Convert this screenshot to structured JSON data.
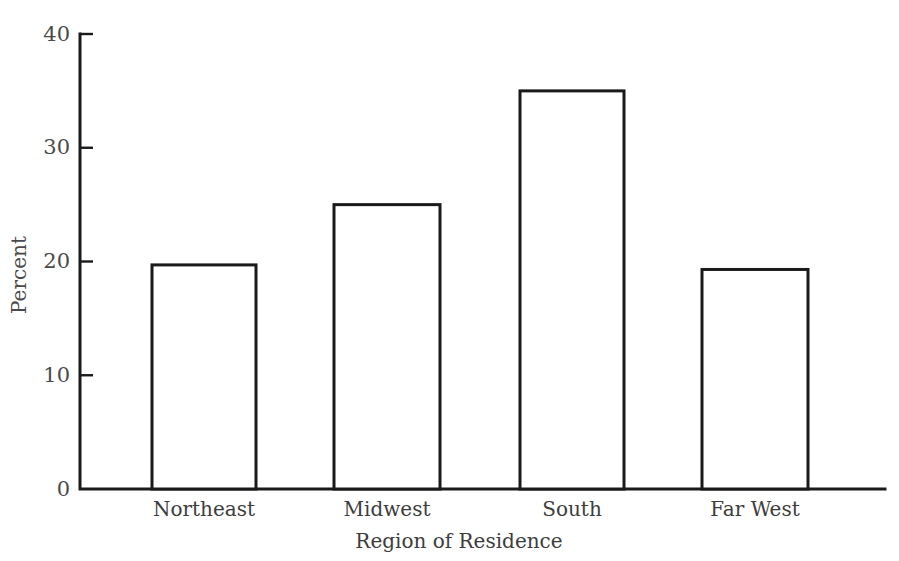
{
  "chart_data": {
    "type": "bar",
    "title": "",
    "subtitle": "",
    "categories": [
      "Northeast",
      "Midwest",
      "South",
      "Far West"
    ],
    "values": [
      19.7,
      25.0,
      35.0,
      19.3
    ],
    "xlabel": "Region of Residence",
    "ylabel": "Percent",
    "ylim": [
      0,
      40
    ],
    "yticks": [
      0,
      10,
      20,
      30,
      40
    ],
    "ytick_labels": [
      "0",
      "10",
      "20",
      "30",
      "40"
    ],
    "grid": false,
    "legend": null,
    "bar_style": {
      "fill": "#ffffff",
      "edge_color": "#1a1a1a",
      "edge_width": 3
    },
    "axis_color": "#1a1a1a",
    "background": "#ffffff"
  },
  "axes": {
    "y_tick_0": "0",
    "y_tick_1": "10",
    "y_tick_2": "20",
    "y_tick_3": "30",
    "y_tick_4": "40",
    "y_title": "Percent",
    "x_title": "Region of Residence"
  },
  "categories": {
    "c0": "Northeast",
    "c1": "Midwest",
    "c2": "South",
    "c3": "Far West"
  }
}
